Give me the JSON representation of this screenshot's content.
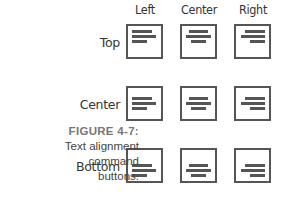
{
  "columns": [
    "Left",
    "Center",
    "Right"
  ],
  "rows": [
    "Top",
    "Center",
    "Bottom"
  ],
  "caption": {
    "figure": "FIGURE 4-7:",
    "line1": "Text alignment",
    "line2": "command",
    "line3": "buttons."
  },
  "colors": {
    "stroke": "#555555",
    "text": "#333333"
  }
}
